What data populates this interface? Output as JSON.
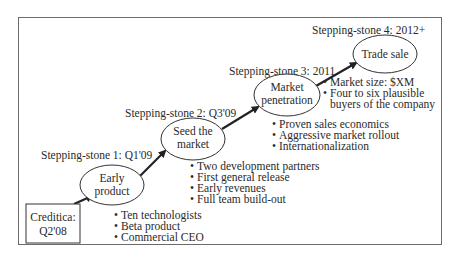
{
  "start": {
    "lines": [
      "Creditica:",
      "Q2'08"
    ]
  },
  "stones": [
    {
      "label": "Stepping-stone 1: Q1'09",
      "node_lines": [
        "Early",
        "product"
      ],
      "bullets": [
        "Ten technologists",
        "Beta product",
        "Commercial CEO"
      ]
    },
    {
      "label": "Stepping-stone 2: Q3'09",
      "node_lines": [
        "Seed the",
        "market"
      ],
      "bullets": [
        "Two development partners",
        "First general release",
        "Early revenues",
        "Full team build-out"
      ]
    },
    {
      "label": "Stepping-stone 3: 2011",
      "node_lines": [
        "Market",
        "penetration"
      ],
      "bullets": [
        "Proven sales economics",
        "Aggressive market rollout",
        "Internationalization"
      ]
    },
    {
      "label": "Stepping-stone 4: 2012+",
      "node_lines": [
        "Trade sale"
      ],
      "bullets": [
        "Market size: $XM",
        "Four to six plausible",
        "buyers of the company"
      ]
    }
  ],
  "bullet_glyph": "•",
  "colors": {
    "border": "#6b6b6b",
    "stroke": "#333333",
    "text": "#2a2a2a"
  }
}
